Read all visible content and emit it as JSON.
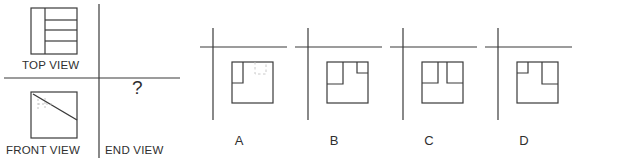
{
  "canvas": {
    "width": 623,
    "height": 163,
    "background": "#ffffff"
  },
  "style": {
    "line_color": "#3a3a3a",
    "hidden_line_color": "#b9b9b9",
    "text_color": "#2f2f2f",
    "stroke_width": 1.2
  },
  "problem": {
    "type": "orthographic-projection-multiple-choice",
    "prompt_symbol": "?",
    "given_views": [
      {
        "name": "top-view",
        "label": "TOP VIEW",
        "quadrant": "upper-left",
        "description": "Square outline with an F-shaped / E-shaped internal notch pattern: a vertical band on the left, with two horizontal bars projecting to the right edge creating two notches open to the right.",
        "outline": {
          "x": 31,
          "y": 8,
          "w": 46,
          "h": 46
        },
        "internal_lines": [
          {
            "from": [
              45,
              8
            ],
            "to": [
              45,
              54
            ],
            "kind": "visible",
            "note": "vertical divider of left band"
          },
          {
            "from": [
              45,
              20
            ],
            "to": [
              77,
              20
            ],
            "kind": "visible",
            "note": "upper horizontal bar top"
          },
          {
            "from": [
              45,
              30
            ],
            "to": [
              77,
              30
            ],
            "kind": "visible",
            "note": "upper horizontal bar bottom"
          },
          {
            "from": [
              45,
              41
            ],
            "to": [
              77,
              41
            ],
            "kind": "visible",
            "note": "lower horizontal bar top"
          }
        ]
      },
      {
        "name": "front-view",
        "label": "FRONT VIEW",
        "quadrant": "lower-left",
        "description": "Square outline with a diagonal line from upper-left corner area down to the right edge, plus faint hidden (dashed) lines in the upper-left region.",
        "outline": {
          "x": 31,
          "y": 92,
          "w": 46,
          "h": 46
        },
        "diagonal": {
          "from": [
            33,
            94
          ],
          "to": [
            77,
            120
          ],
          "kind": "visible"
        },
        "hidden_lines": [
          {
            "from": [
              38,
              99
            ],
            "to": [
              38,
              110
            ],
            "kind": "hidden"
          },
          {
            "from": [
              38,
              104
            ],
            "to": [
              52,
              104
            ],
            "kind": "hidden"
          },
          {
            "from": [
              45,
              98
            ],
            "to": [
              45,
              108
            ],
            "kind": "hidden"
          }
        ]
      },
      {
        "name": "end-view",
        "label": "END VIEW",
        "quadrant": "lower-right",
        "content": "?",
        "description": "Unknown view to be determined; marked with a question mark."
      }
    ],
    "projection_axes": {
      "vertical_divider": {
        "x": 99,
        "y1": 4,
        "y2": 158
      },
      "horizontal_divider": {
        "y": 78,
        "x1": 4,
        "x2": 180
      }
    },
    "labels": {
      "top_view": "TOP VIEW",
      "front_view": "FRONT VIEW",
      "end_view": "END VIEW",
      "question_mark": "?"
    }
  },
  "options": [
    {
      "id": "A",
      "label": "A",
      "center_x": 238,
      "axis": {
        "vertical_x": 213,
        "vertical_y1": 28,
        "vertical_y2": 120,
        "horizontal_y": 47,
        "horizontal_x1": 200,
        "horizontal_x2": 287
      },
      "square": {
        "x": 232,
        "y": 62,
        "w": 41,
        "h": 41
      },
      "features": [
        {
          "kind": "visible",
          "shape": "rect",
          "x": 232,
          "y": 62,
          "w": 11,
          "h": 21,
          "note": "narrow tall rectangle notch at upper-left"
        },
        {
          "kind": "hidden",
          "shape": "rect",
          "x": 255,
          "y": 64,
          "w": 11,
          "h": 10,
          "note": "faint dashed hidden detail to the right"
        }
      ],
      "description": "Square with one narrow tall notch at the upper-left and faint dashed hidden lines to the right."
    },
    {
      "id": "B",
      "label": "B",
      "center_x": 333,
      "axis": {
        "vertical_x": 308,
        "vertical_y1": 28,
        "vertical_y2": 120,
        "horizontal_y": 47,
        "horizontal_x1": 295,
        "horizontal_x2": 382
      },
      "square": {
        "x": 327,
        "y": 62,
        "w": 41,
        "h": 41
      },
      "features": [
        {
          "kind": "visible",
          "shape": "rect",
          "x": 327,
          "y": 62,
          "w": 16,
          "h": 22,
          "note": "tall rectangle notch at upper-left"
        },
        {
          "kind": "visible",
          "shape": "rect",
          "x": 357,
          "y": 62,
          "w": 11,
          "h": 11,
          "note": "smaller rectangle notch at upper-right"
        }
      ],
      "description": "Square with a tall notch at the upper-left and a shorter, smaller notch at the upper-right."
    },
    {
      "id": "C",
      "label": "C",
      "center_x": 428,
      "axis": {
        "vertical_x": 403,
        "vertical_y1": 28,
        "vertical_y2": 120,
        "horizontal_y": 47,
        "horizontal_x1": 390,
        "horizontal_x2": 477
      },
      "square": {
        "x": 422,
        "y": 62,
        "w": 41,
        "h": 41
      },
      "features": [
        {
          "kind": "visible",
          "shape": "rect",
          "x": 422,
          "y": 62,
          "w": 16,
          "h": 21,
          "note": "tall notch upper-left"
        },
        {
          "kind": "visible",
          "shape": "rect",
          "x": 447,
          "y": 62,
          "w": 16,
          "h": 21,
          "note": "tall notch upper-right, same depth"
        }
      ],
      "description": "Square with two equal-depth tall notches at the top, separated by a tab in the middle."
    },
    {
      "id": "D",
      "label": "D",
      "center_x": 523,
      "axis": {
        "vertical_x": 498,
        "vertical_y1": 28,
        "vertical_y2": 120,
        "horizontal_y": 47,
        "horizontal_x1": 485,
        "horizontal_x2": 572
      },
      "square": {
        "x": 517,
        "y": 62,
        "w": 41,
        "h": 41
      },
      "features": [
        {
          "kind": "visible",
          "shape": "rect",
          "x": 517,
          "y": 62,
          "w": 11,
          "h": 11,
          "note": "short notch at upper-left"
        },
        {
          "kind": "visible",
          "shape": "rect",
          "x": 542,
          "y": 62,
          "w": 16,
          "h": 22,
          "note": "tall notch at upper-right"
        }
      ],
      "description": "Square with a short shallow notch at the upper-left and a tall deep notch at the upper-right."
    }
  ]
}
